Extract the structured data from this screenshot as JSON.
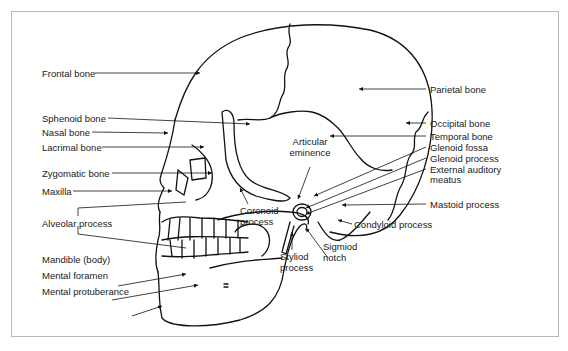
{
  "diagram": {
    "labels_left": [
      {
        "id": "frontal",
        "text": "Frontal bone"
      },
      {
        "id": "sphenoid",
        "text": "Sphenoid bone"
      },
      {
        "id": "nasal",
        "text": "Nasal bone"
      },
      {
        "id": "lacrimal",
        "text": "Lacrimal bone"
      },
      {
        "id": "zygomatic",
        "text": "Zygomatic bone"
      },
      {
        "id": "maxilla",
        "text": "Maxilla"
      },
      {
        "id": "alveolar",
        "text": "Alveolar process"
      },
      {
        "id": "mandible",
        "text": "Mandible (body)"
      },
      {
        "id": "mental_foramen",
        "text": "Mental foramen"
      },
      {
        "id": "mental_protuberance",
        "text": "Mental protuberance"
      }
    ],
    "labels_right": [
      {
        "id": "parietal",
        "text": "Parietal bone"
      },
      {
        "id": "occipital",
        "text": "Occipital bone"
      },
      {
        "id": "temporal",
        "text": "Temporal bone"
      },
      {
        "id": "glenoid_fossa",
        "text": "Glenoid fossa"
      },
      {
        "id": "glenoid_process",
        "text": "Glenoid process"
      },
      {
        "id": "external_auditory",
        "text": "External auditory"
      },
      {
        "id": "external_auditory_2",
        "text": "meatus"
      },
      {
        "id": "mastoid",
        "text": "Mastoid process"
      }
    ],
    "labels_center": [
      {
        "id": "articular_1",
        "text": "Articular"
      },
      {
        "id": "articular_2",
        "text": "eminence"
      },
      {
        "id": "coronoid_1",
        "text": "Coronoid"
      },
      {
        "id": "coronoid_2",
        "text": "process"
      },
      {
        "id": "condyloid",
        "text": "Condyloid process"
      },
      {
        "id": "styloid_1",
        "text": "Styliod"
      },
      {
        "id": "styloid_2",
        "text": "process"
      },
      {
        "id": "sigmoid_1",
        "text": "Sigmiod"
      },
      {
        "id": "sigmoid_2",
        "text": "notch"
      }
    ]
  }
}
